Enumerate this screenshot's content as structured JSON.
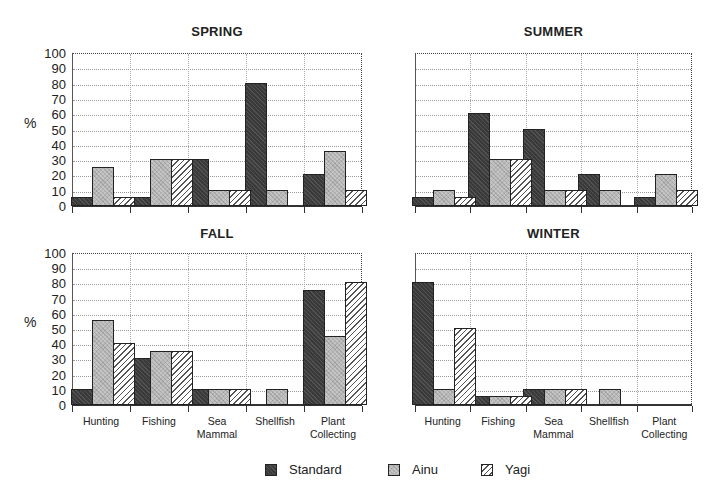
{
  "chart_data": [
    {
      "type": "bar",
      "title": "SPRING",
      "ylabel": "%",
      "xlabel": "",
      "ylim": [
        0,
        100
      ],
      "yticks": [
        0,
        10,
        20,
        30,
        40,
        50,
        60,
        70,
        80,
        90,
        100
      ],
      "grid": true,
      "categories": [
        "Hunting",
        "Fishing",
        "Sea Mammal",
        "Shellfish",
        "Plant Collecting"
      ],
      "series": [
        {
          "name": "Standard",
          "values": [
            5,
            5,
            30,
            80,
            20
          ]
        },
        {
          "name": "Ainu",
          "values": [
            25,
            30,
            10,
            10,
            35
          ]
        },
        {
          "name": "Yagi",
          "values": [
            5,
            30,
            10,
            0,
            10
          ]
        }
      ]
    },
    {
      "type": "bar",
      "title": "SUMMER",
      "ylabel": "",
      "xlabel": "",
      "ylim": [
        0,
        100
      ],
      "grid": true,
      "categories": [
        "Hunting",
        "Fishing",
        "Sea Mammal",
        "Shellfish",
        "Plant Collecting"
      ],
      "series": [
        {
          "name": "Standard",
          "values": [
            5,
            60,
            50,
            20,
            5
          ]
        },
        {
          "name": "Ainu",
          "values": [
            10,
            30,
            10,
            10,
            20
          ]
        },
        {
          "name": "Yagi",
          "values": [
            5,
            30,
            10,
            0,
            10
          ]
        }
      ]
    },
    {
      "type": "bar",
      "title": "FALL",
      "ylabel": "%",
      "xlabel": "",
      "ylim": [
        0,
        100
      ],
      "yticks": [
        0,
        10,
        20,
        30,
        40,
        50,
        60,
        70,
        80,
        90,
        100
      ],
      "grid": true,
      "categories": [
        "Hunting",
        "Fishing",
        "Sea Mammal",
        "Shellfish",
        "Plant Collecting"
      ],
      "series": [
        {
          "name": "Standard",
          "values": [
            10,
            30,
            10,
            0,
            75
          ]
        },
        {
          "name": "Ainu",
          "values": [
            55,
            35,
            10,
            10,
            45
          ]
        },
        {
          "name": "Yagi",
          "values": [
            40,
            35,
            10,
            0,
            80
          ]
        }
      ]
    },
    {
      "type": "bar",
      "title": "WINTER",
      "ylabel": "",
      "xlabel": "",
      "ylim": [
        0,
        100
      ],
      "grid": true,
      "categories": [
        "Hunting",
        "Fishing",
        "Sea Mammal",
        "Shellfish",
        "Plant Collecting"
      ],
      "series": [
        {
          "name": "Standard",
          "values": [
            80,
            5,
            10,
            0,
            0
          ]
        },
        {
          "name": "Ainu",
          "values": [
            10,
            5,
            10,
            10,
            0
          ]
        },
        {
          "name": "Yagi",
          "values": [
            50,
            5,
            10,
            0,
            0
          ]
        }
      ]
    }
  ],
  "panels": {
    "spring": {
      "title": "SPRING"
    },
    "summer": {
      "title": "SUMMER"
    },
    "fall": {
      "title": "FALL"
    },
    "winter": {
      "title": "WINTER"
    }
  },
  "axis": {
    "ylabel": "%",
    "yticks": [
      "100",
      "90",
      "80",
      "70",
      "60",
      "50",
      "40",
      "30",
      "20",
      "10",
      "0"
    ],
    "categories": [
      {
        "line1": "Hunting",
        "line2": ""
      },
      {
        "line1": "Fishing",
        "line2": ""
      },
      {
        "line1": "Sea",
        "line2": "Mammal"
      },
      {
        "line1": "Shellfish",
        "line2": ""
      },
      {
        "line1": "Plant",
        "line2": "Collecting"
      }
    ]
  },
  "legend": {
    "items": [
      {
        "label": "Standard",
        "pattern": "dark-crosshatch"
      },
      {
        "label": "Ainu",
        "pattern": "light-crosshatch"
      },
      {
        "label": "Yagi",
        "pattern": "diagonal-hatch"
      }
    ]
  },
  "colors": {
    "standard": "#3a3a3a",
    "ainu": "#c4c4c4",
    "yagi": "#ffffff",
    "outline": "#222222"
  }
}
